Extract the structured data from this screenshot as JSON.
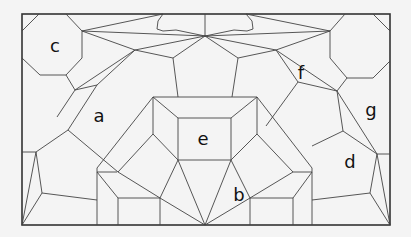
{
  "diagram": {
    "type": "tiling-puzzle",
    "background": "#f4f4f4",
    "stroke_color": "#444444",
    "frame": {
      "x1": 22,
      "y1": 14,
      "x2": 390,
      "y2": 225
    },
    "labels": [
      {
        "id": "a",
        "text": "a",
        "x": 99,
        "y": 117
      },
      {
        "id": "b",
        "text": "b",
        "x": 239,
        "y": 196
      },
      {
        "id": "c",
        "text": "c",
        "x": 55,
        "y": 47
      },
      {
        "id": "d",
        "text": "d",
        "x": 350,
        "y": 163
      },
      {
        "id": "e",
        "text": "e",
        "x": 203,
        "y": 140
      },
      {
        "id": "f",
        "text": "f",
        "x": 301,
        "y": 74
      },
      {
        "id": "g",
        "text": "g",
        "x": 371,
        "y": 111
      }
    ]
  }
}
